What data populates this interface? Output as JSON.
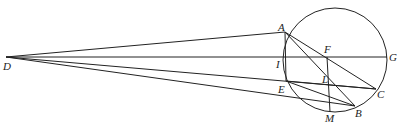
{
  "diagram": {
    "type": "geometry",
    "stroke_color": "#222222",
    "circle": {
      "cx": 335,
      "cy": 60,
      "r": 52
    },
    "points": {
      "D": {
        "x": 6,
        "y": 57,
        "label": "D",
        "lx": 3,
        "ly": 70
      },
      "A": {
        "x": 285,
        "y": 32,
        "label": "A",
        "lx": 278,
        "ly": 31
      },
      "G": {
        "x": 387,
        "y": 57,
        "label": "G",
        "lx": 389,
        "ly": 61
      },
      "F": {
        "x": 327,
        "y": 57,
        "label": "F",
        "lx": 324,
        "ly": 53
      },
      "I": {
        "x": 285,
        "y": 57,
        "label": "I",
        "lx": 276,
        "ly": 68
      },
      "E": {
        "x": 286,
        "y": 81,
        "label": "E",
        "lx": 278,
        "ly": 93
      },
      "L": {
        "x": 329,
        "y": 80,
        "label": "L",
        "lx": 322,
        "ly": 83
      },
      "C": {
        "x": 376,
        "y": 89,
        "label": "C",
        "lx": 377,
        "ly": 98
      },
      "B": {
        "x": 355,
        "y": 106,
        "label": "B",
        "lx": 355,
        "ly": 117
      },
      "M": {
        "x": 330,
        "y": 112,
        "label": "M",
        "lx": 325,
        "ly": 122
      }
    },
    "segments": [
      [
        "D",
        "A"
      ],
      [
        "D",
        "G"
      ],
      [
        "D",
        "C"
      ],
      [
        "D",
        "B"
      ],
      [
        "A",
        "E"
      ],
      [
        "A",
        "C"
      ],
      [
        "A",
        "B"
      ],
      [
        "E",
        "C"
      ],
      [
        "E",
        "B"
      ],
      [
        "F",
        "M"
      ]
    ]
  }
}
